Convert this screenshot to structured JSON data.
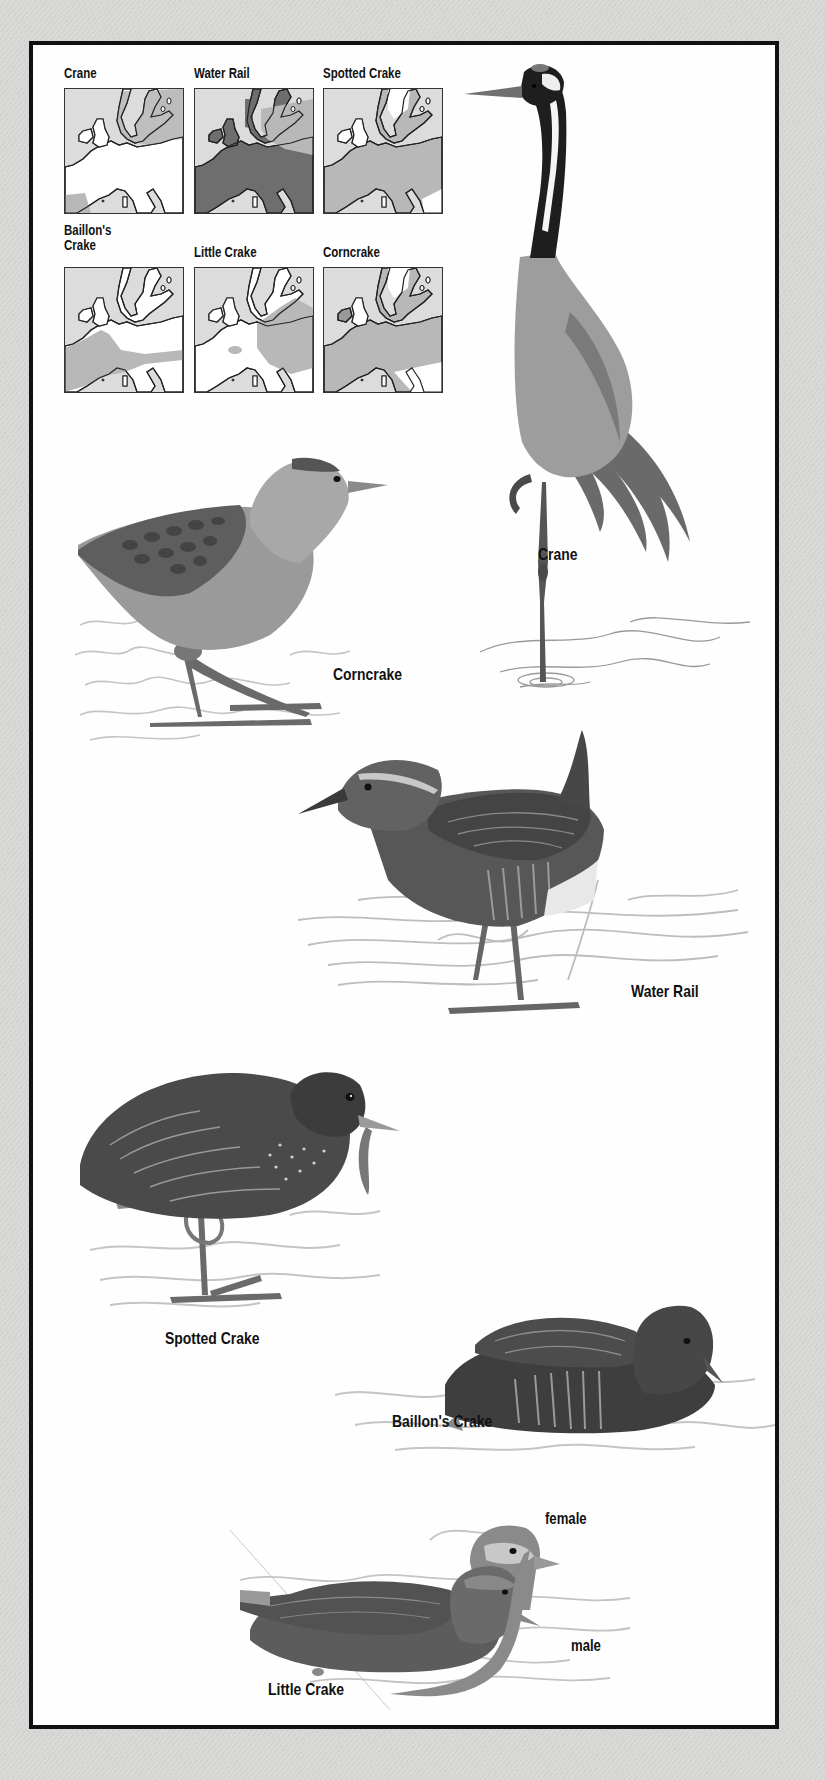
{
  "colors": {
    "page_bg": "#d7d7d5",
    "frame_bg": "#fefefe",
    "frame_border": "#111111",
    "map_land": "#ffffff",
    "map_sea": "#dcdcdc",
    "map_range_light": "#b8b8b8",
    "map_range_dark": "#6e6e6e"
  },
  "maps": [
    {
      "title": "Crane",
      "range_style": "light_north"
    },
    {
      "title": "Water Rail",
      "range_style": "dark_widespread"
    },
    {
      "title": "Spotted Crake",
      "range_style": "light_widespread"
    },
    {
      "title_line1": "Baillon's",
      "title_line2": "Crake",
      "range_style": "light_southwest"
    },
    {
      "title": "Little Crake",
      "range_style": "light_east"
    },
    {
      "title": "Corncrake",
      "range_style": "light_widespread"
    }
  ],
  "illustrations": [
    {
      "label": "Crane"
    },
    {
      "label": "Corncrake"
    },
    {
      "label": "Water Rail"
    },
    {
      "label": "Spotted Crake"
    },
    {
      "label": "Baillon's Crake"
    },
    {
      "label": "Little Crake",
      "sub_labels": [
        "female",
        "male"
      ]
    }
  ]
}
